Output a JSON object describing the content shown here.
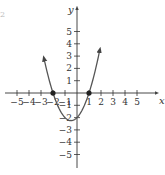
{
  "corner_mark": "2",
  "chart_data": {
    "type": "line",
    "title": "",
    "function": "y = x^2 + x - 2",
    "xlabel": "x",
    "ylabel": "y",
    "xlim": [
      -5.5,
      5.5
    ],
    "ylim": [
      -5.5,
      5.5
    ],
    "grid": false,
    "x_ticks": [
      -5,
      -4,
      -3,
      -2,
      -1,
      1,
      2,
      3,
      4,
      5
    ],
    "y_ticks": [
      -5,
      -4,
      -3,
      -2,
      -1,
      1,
      2,
      3,
      4,
      5
    ],
    "x_tick_labels": [
      "−5",
      "−4",
      "−3",
      "−2",
      "−1",
      "1",
      "2",
      "3",
      "4",
      "5"
    ],
    "y_tick_labels": [
      "−5",
      "−4",
      "−3",
      "−2",
      "−1",
      "1",
      "2",
      "3",
      "4",
      "5"
    ],
    "series": [
      {
        "name": "parabola",
        "x": [
          -2.75,
          -2.5,
          -2,
          -1.5,
          -1,
          -0.5,
          0,
          0.5,
          1,
          1.5,
          1.9
        ],
        "y": [
          4.81,
          3.75,
          0,
          -1.25,
          -2,
          -2.25,
          -2,
          -1.25,
          0,
          1.75,
          3.51
        ],
        "arrows_at_ends": true,
        "color": "#555555"
      }
    ],
    "marked_points": [
      {
        "x": -2,
        "y": 0,
        "label": "x-intercept"
      },
      {
        "x": 1,
        "y": 0,
        "label": "x-intercept"
      }
    ],
    "colors": {
      "axis": "#333333",
      "curve": "#555555",
      "points": "#222222"
    }
  }
}
